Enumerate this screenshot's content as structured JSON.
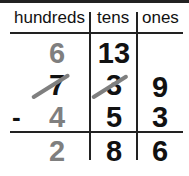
{
  "headers": [
    "hundreds",
    "tens",
    "ones"
  ],
  "rows": {
    "regroup": {
      "hundreds": "6",
      "tens": "13",
      "ones": ""
    },
    "minuend": {
      "hundreds": "7",
      "tens": "3",
      "ones": "9"
    },
    "subtrahend": {
      "operator": "-",
      "hundreds": "4",
      "tens": "5",
      "ones": "3"
    },
    "difference": {
      "hundreds": "2",
      "tens": "8",
      "ones": "6"
    }
  },
  "colors": {
    "gray": "#7f7f7f",
    "black": "#111111"
  }
}
